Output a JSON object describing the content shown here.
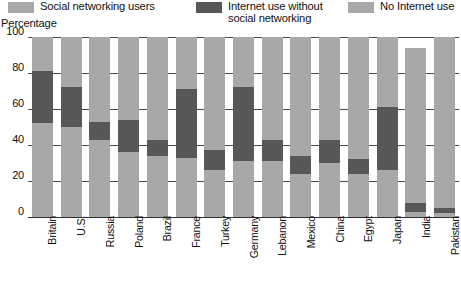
{
  "legend": {
    "items": [
      {
        "label": "Social networking users",
        "color": "#a8a8a8"
      },
      {
        "label": "Internet use without\nsocial networking",
        "color": "#575757"
      },
      {
        "label": "No Internet use",
        "color": "#a8a8a8"
      }
    ]
  },
  "axis": {
    "ylabel": "Percentage",
    "yticks": [
      "100",
      "80",
      "60",
      "40",
      "20",
      "0"
    ]
  },
  "chart_data": {
    "type": "bar",
    "stacked": true,
    "title": "",
    "subtitle": "",
    "xlabel": "",
    "ylabel": "Percentage",
    "ylim": [
      0,
      100
    ],
    "yticks": [
      0,
      20,
      40,
      60,
      80,
      100
    ],
    "grid": true,
    "legend_position": "top",
    "categories": [
      "Britain",
      "U.S.",
      "Russia",
      "Poland",
      "Brazil",
      "France",
      "Turkey",
      "Germany",
      "Lebanon",
      "Mexico",
      "China",
      "Egypt",
      "Japan",
      "India",
      "Pakistan"
    ],
    "series": [
      {
        "name": "Social networking users",
        "color": "#a8a8a8",
        "values": [
          52,
          50,
          43,
          36,
          34,
          33,
          26,
          31,
          31,
          24,
          30,
          24,
          26,
          3,
          2
        ]
      },
      {
        "name": "Internet use without social networking",
        "color": "#575757",
        "values": [
          29,
          22,
          10,
          18,
          9,
          38,
          11,
          41,
          12,
          10,
          13,
          8,
          35,
          5,
          3
        ]
      },
      {
        "name": "No Internet use",
        "color": "#a8a8a8",
        "values": [
          19,
          28,
          47,
          46,
          57,
          29,
          63,
          28,
          57,
          66,
          57,
          68,
          39,
          86,
          95
        ]
      }
    ]
  }
}
